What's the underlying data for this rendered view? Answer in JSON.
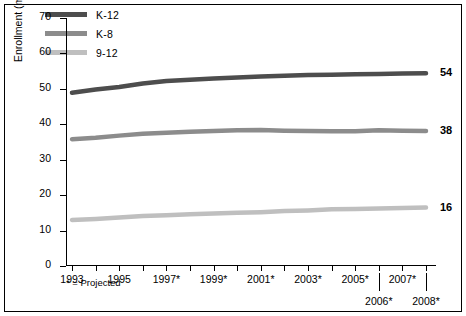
{
  "chart_data": {
    "type": "line",
    "title": "",
    "xlabel": "",
    "ylabel": "Enrollment (millions)",
    "ylim": [
      0,
      70
    ],
    "yticks": [
      0,
      10,
      20,
      30,
      40,
      50,
      60,
      70
    ],
    "grid": false,
    "legend_position": "top-left",
    "x": [
      "1993",
      "1994",
      "1995",
      "1996",
      "1997*",
      "1998*",
      "1999*",
      "2000*",
      "2001*",
      "2002*",
      "2003*",
      "2004*",
      "2005*",
      "2006*",
      "2007*",
      "2008*"
    ],
    "xtick_labels_row1": [
      "1993",
      "1995",
      "1997*",
      "1999*",
      "2001*",
      "2003*",
      "2005*",
      "2007*"
    ],
    "xtick_labels_row2": [
      "2006*",
      "2008*"
    ],
    "series": [
      {
        "name": "K-12",
        "color": "#4d4d4d",
        "end_label": "54",
        "values": [
          48.9,
          49.8,
          50.5,
          51.5,
          52.2,
          52.6,
          52.9,
          53.2,
          53.5,
          53.7,
          53.9,
          54.0,
          54.1,
          54.2,
          54.3,
          54.4
        ]
      },
      {
        "name": "K-8",
        "color": "#8c8c8c",
        "end_label": "38",
        "values": [
          35.8,
          36.2,
          36.8,
          37.3,
          37.6,
          37.9,
          38.1,
          38.3,
          38.4,
          38.2,
          38.1,
          38.0,
          38.0,
          38.3,
          38.2,
          38.1
        ]
      },
      {
        "name": "9-12",
        "color": "#bfbfbf",
        "end_label": "16",
        "values": [
          13.0,
          13.3,
          13.7,
          14.1,
          14.3,
          14.6,
          14.8,
          15.0,
          15.2,
          15.5,
          15.7,
          16.0,
          16.1,
          16.2,
          16.4,
          16.5
        ]
      }
    ],
    "footnote": "* = Projected"
  }
}
